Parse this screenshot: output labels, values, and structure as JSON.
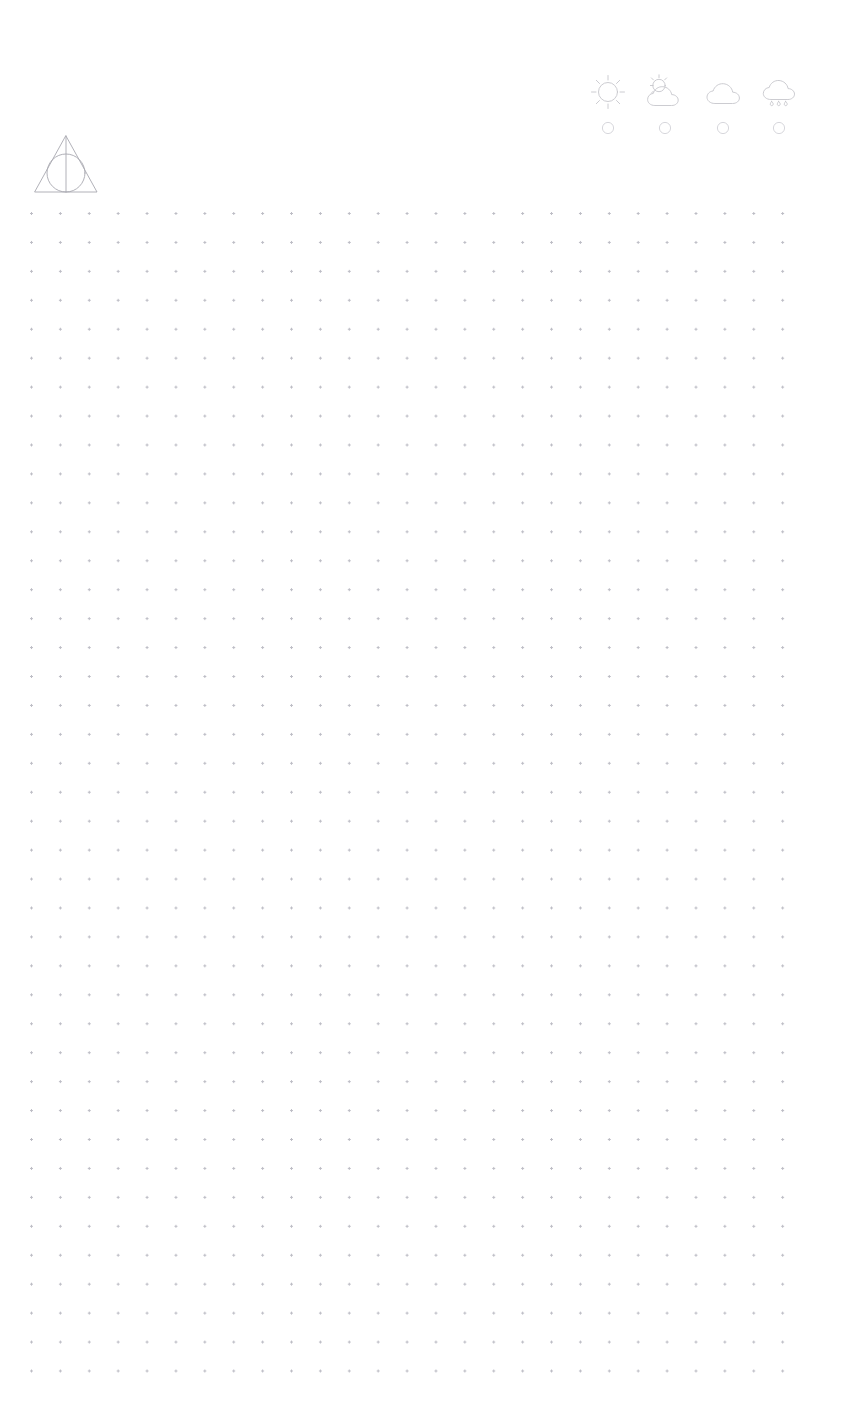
{
  "page": {
    "background_color": "#ffffff",
    "width": 841,
    "height": 1404
  },
  "logo": {
    "name": "Deathly Hallows symbol",
    "stroke_color": "#a8a8b0",
    "description": "Triangle with inscribed circle and vertical line"
  },
  "grid": {
    "dot_color": "#b9b9c2",
    "dot_spacing": "29",
    "columns": "27",
    "rows": "41"
  },
  "weather": {
    "stroke_color": "#c6c6cc",
    "selector_color": "#d2d2d8",
    "items": [
      {
        "icon": "sun-icon",
        "label": "Sunny",
        "selected": "false"
      },
      {
        "icon": "sun-behind-cloud-icon",
        "label": "Partly Cloudy",
        "selected": "false"
      },
      {
        "icon": "cloud-icon",
        "label": "Cloudy",
        "selected": "false"
      },
      {
        "icon": "cloud-rain-icon",
        "label": "Rainy",
        "selected": "false"
      }
    ]
  }
}
